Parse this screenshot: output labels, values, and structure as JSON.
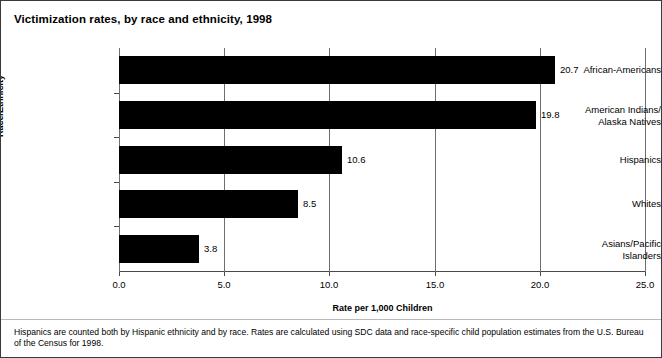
{
  "figure": {
    "title": "Victimization rates, by race and ethnicity, 1998",
    "footnote": "Hispanics are counted both by Hispanic ethnicity and by race. Rates are calculated using SDC data and race-specific child population estimates from the U.S. Bureau of the Census for 1998."
  },
  "chart_data": {
    "type": "bar",
    "orientation": "horizontal",
    "title": "Victimization rates, by race and ethnicity, 1998",
    "xlabel": "Rate per 1,000 Children",
    "ylabel": "Race/Ethnicity",
    "categories": [
      "African-Americans",
      "American Indians/ Alaska Natives",
      "Hispanics",
      "Whites",
      "Asians/Pacific Islanders"
    ],
    "category_lines": [
      [
        "African-Americans"
      ],
      [
        "American Indians/",
        "Alaska Natives"
      ],
      [
        "Hispanics"
      ],
      [
        "Whites"
      ],
      [
        "Asians/Pacific",
        "Islanders"
      ]
    ],
    "values": [
      20.7,
      19.8,
      10.6,
      8.5,
      3.8
    ],
    "value_labels": [
      "20.7",
      "19.8",
      "10.6",
      "8.5",
      "3.8"
    ],
    "xlim": [
      0.0,
      25.0
    ],
    "xticks": [
      0.0,
      5.0,
      10.0,
      15.0,
      20.0,
      25.0
    ],
    "xtick_labels": [
      "0.0",
      "5.0",
      "10.0",
      "15.0",
      "20.0",
      "25.0"
    ],
    "grid": "vertical",
    "legend": "none",
    "bar_color": "#000000"
  }
}
